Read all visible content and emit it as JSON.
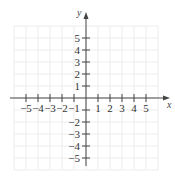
{
  "figure": {
    "type": "coordinate-plane",
    "x_axis_label": "x",
    "y_axis_label": "y",
    "x_range": [
      -6,
      6
    ],
    "y_range": [
      -6,
      6
    ],
    "x_tick_labels": [
      "-5",
      "-4",
      "-3",
      "-2",
      "-1",
      "1",
      "2",
      "3",
      "4",
      "5"
    ],
    "y_tick_labels": [
      "5",
      "4",
      "3",
      "2",
      "1",
      "-2",
      "-3",
      "-4",
      "-5"
    ],
    "grid": true,
    "colors": {
      "axis": "#444444",
      "grid": "#ececec",
      "text": "#333333"
    }
  }
}
